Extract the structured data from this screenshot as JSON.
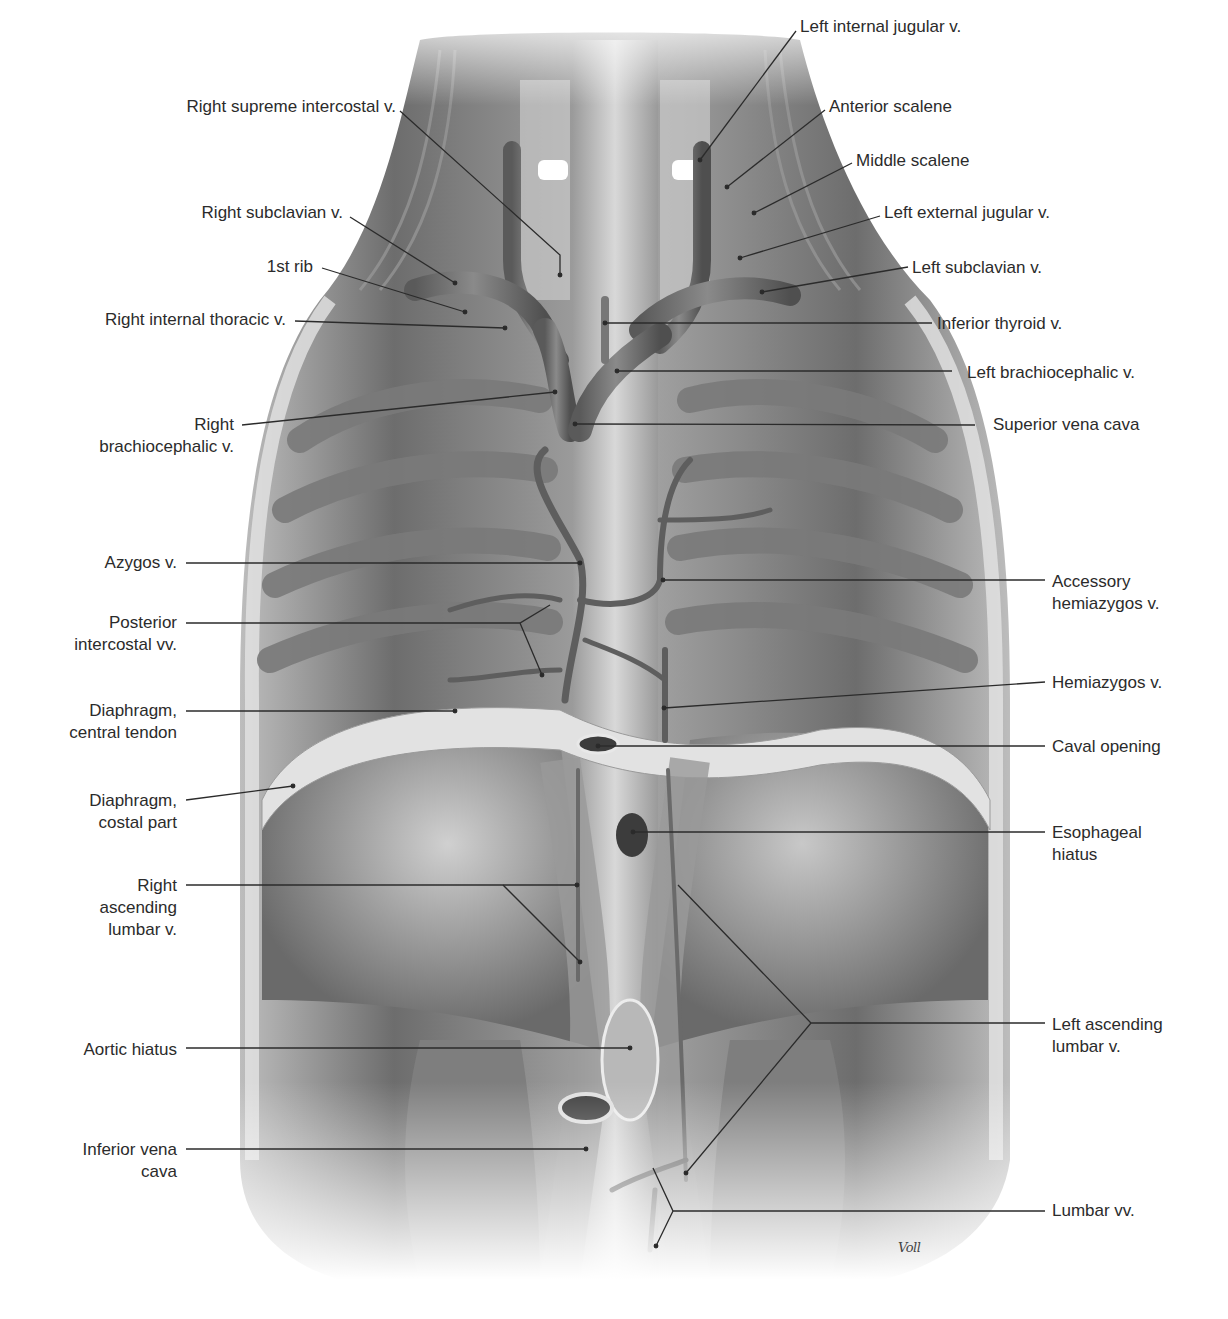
{
  "figure": {
    "signature": "Voll",
    "palette": {
      "background": "#ffffff",
      "tissue_dark": "#5a5a5a",
      "tissue_mid": "#8c8c8c",
      "tissue_light": "#d4d4d4",
      "vein": "#6e6e6e",
      "text": "#2b2b2b",
      "leader": "#2b2b2b"
    }
  },
  "labels": {
    "left": [
      {
        "id": "right-supreme-intercostal-v",
        "lines": [
          "Right supreme intercostal v."
        ],
        "x": 396,
        "y": 96,
        "line": [
          [
            400,
            111
          ],
          [
            560,
            255
          ],
          [
            560,
            275
          ]
        ]
      },
      {
        "id": "right-subclavian-v",
        "lines": [
          "Right subclavian v."
        ],
        "x": 343,
        "y": 202,
        "line": [
          [
            350,
            217
          ],
          [
            455,
            283
          ]
        ]
      },
      {
        "id": "first-rib",
        "lines": [
          "1st rib"
        ],
        "x": 313,
        "y": 256,
        "line": [
          [
            322,
            268
          ],
          [
            465,
            312
          ]
        ]
      },
      {
        "id": "right-internal-thoracic-v",
        "lines": [
          "Right internal thoracic v."
        ],
        "x": 286,
        "y": 309,
        "line": [
          [
            295,
            321
          ],
          [
            505,
            328
          ]
        ]
      },
      {
        "id": "right-brachiocephalic-v",
        "lines": [
          "Right",
          "brachiocephalic v."
        ],
        "x": 234,
        "y": 414,
        "line": [
          [
            242,
            425
          ],
          [
            555,
            392
          ]
        ]
      },
      {
        "id": "azygos-v",
        "lines": [
          "Azygos v."
        ],
        "x": 177,
        "y": 552,
        "line": [
          [
            186,
            563
          ],
          [
            580,
            563
          ]
        ]
      },
      {
        "id": "posterior-intercostal-vv",
        "lines": [
          "Posterior",
          "intercostal vv."
        ],
        "x": 177,
        "y": 612,
        "line": [
          [
            186,
            623
          ],
          [
            520,
            623
          ],
          [
            550,
            605
          ],
          [
            520,
            623
          ],
          [
            542,
            675
          ]
        ]
      },
      {
        "id": "diaphragm-central-tendon",
        "lines": [
          "Diaphragm,",
          "central tendon"
        ],
        "x": 177,
        "y": 700,
        "line": [
          [
            186,
            711
          ],
          [
            455,
            711
          ]
        ]
      },
      {
        "id": "diaphragm-costal-part",
        "lines": [
          "Diaphragm,",
          "costal part"
        ],
        "x": 177,
        "y": 790,
        "line": [
          [
            186,
            800
          ],
          [
            293,
            786
          ]
        ]
      },
      {
        "id": "right-ascending-lumbar-v",
        "lines": [
          "Right",
          "ascending",
          "lumbar v."
        ],
        "x": 177,
        "y": 875,
        "line": [
          [
            186,
            885
          ],
          [
            577,
            885
          ]
        ],
        "extra_line": [
          [
            503,
            885
          ],
          [
            580,
            962
          ]
        ]
      },
      {
        "id": "aortic-hiatus",
        "lines": [
          "Aortic hiatus"
        ],
        "x": 177,
        "y": 1039,
        "line": [
          [
            186,
            1048
          ],
          [
            630,
            1048
          ]
        ]
      },
      {
        "id": "inferior-vena-cava",
        "lines": [
          "Inferior vena",
          "cava"
        ],
        "x": 177,
        "y": 1139,
        "line": [
          [
            186,
            1149
          ],
          [
            586,
            1149
          ]
        ]
      }
    ],
    "right": [
      {
        "id": "left-internal-jugular-v",
        "lines": [
          "Left internal jugular v."
        ],
        "x": 800,
        "y": 16,
        "line": [
          [
            796,
            31
          ],
          [
            700,
            160
          ]
        ]
      },
      {
        "id": "anterior-scalene",
        "lines": [
          "Anterior scalene"
        ],
        "x": 829,
        "y": 96,
        "line": [
          [
            825,
            110
          ],
          [
            727,
            187
          ]
        ]
      },
      {
        "id": "middle-scalene",
        "lines": [
          "Middle scalene"
        ],
        "x": 856,
        "y": 150,
        "line": [
          [
            852,
            163
          ],
          [
            754,
            213
          ]
        ]
      },
      {
        "id": "left-external-jugular-v",
        "lines": [
          "Left external jugular v."
        ],
        "x": 884,
        "y": 202,
        "line": [
          [
            880,
            216
          ],
          [
            740,
            258
          ]
        ]
      },
      {
        "id": "left-subclavian-v",
        "lines": [
          "Left subclavian v."
        ],
        "x": 912,
        "y": 257,
        "line": [
          [
            908,
            267
          ],
          [
            762,
            292
          ]
        ]
      },
      {
        "id": "inferior-thyroid-v",
        "lines": [
          "Inferior thyroid v."
        ],
        "x": 937,
        "y": 313,
        "line": [
          [
            932,
            323
          ],
          [
            605,
            323
          ]
        ]
      },
      {
        "id": "left-brachiocephalic-v",
        "lines": [
          "Left brachiocephalic v."
        ],
        "x": 967,
        "y": 362,
        "line": [
          [
            952,
            371
          ],
          [
            617,
            371
          ]
        ]
      },
      {
        "id": "superior-vena-cava",
        "lines": [
          "Superior vena cava"
        ],
        "x": 993,
        "y": 414,
        "line": [
          [
            975,
            425
          ],
          [
            575,
            424
          ]
        ]
      },
      {
        "id": "accessory-hemiazygos-v",
        "lines": [
          "Accessory",
          "hemiazygos v."
        ],
        "x": 1052,
        "y": 571,
        "line": [
          [
            1045,
            580
          ],
          [
            663,
            580
          ]
        ]
      },
      {
        "id": "hemiazygos-v",
        "lines": [
          "Hemiazygos v."
        ],
        "x": 1052,
        "y": 672,
        "line": [
          [
            1045,
            682
          ],
          [
            664,
            708
          ]
        ]
      },
      {
        "id": "caval-opening",
        "lines": [
          "Caval opening"
        ],
        "x": 1052,
        "y": 736,
        "line": [
          [
            1045,
            746
          ],
          [
            598,
            746
          ]
        ]
      },
      {
        "id": "esophageal-hiatus",
        "lines": [
          "Esophageal",
          "hiatus"
        ],
        "x": 1052,
        "y": 822,
        "line": [
          [
            1045,
            832
          ],
          [
            633,
            832
          ]
        ]
      },
      {
        "id": "left-ascending-lumbar-v",
        "lines": [
          "Left ascending",
          "lumbar v."
        ],
        "x": 1052,
        "y": 1014,
        "line": [
          [
            1045,
            1023
          ],
          [
            811,
            1023
          ],
          [
            678,
            885
          ],
          [
            811,
            1023
          ],
          [
            686,
            1173
          ]
        ]
      },
      {
        "id": "lumbar-vv",
        "lines": [
          "Lumbar vv."
        ],
        "x": 1052,
        "y": 1200,
        "line": [
          [
            1045,
            1211
          ],
          [
            673,
            1211
          ],
          [
            653,
            1168
          ],
          [
            673,
            1211
          ],
          [
            656,
            1246
          ]
        ]
      }
    ]
  }
}
